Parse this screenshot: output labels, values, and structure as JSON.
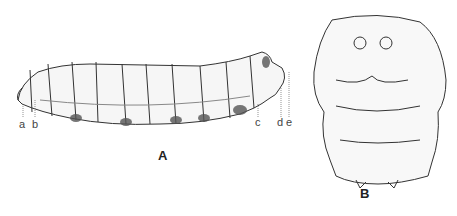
{
  "figure": {
    "panels": [
      {
        "id": "A",
        "label": "A",
        "subject": "larva-lateral-view"
      },
      {
        "id": "B",
        "label": "B",
        "subject": "head-frontal-view"
      }
    ],
    "panel_a_markers": [
      "a",
      "b",
      "c",
      "d",
      "e"
    ]
  }
}
